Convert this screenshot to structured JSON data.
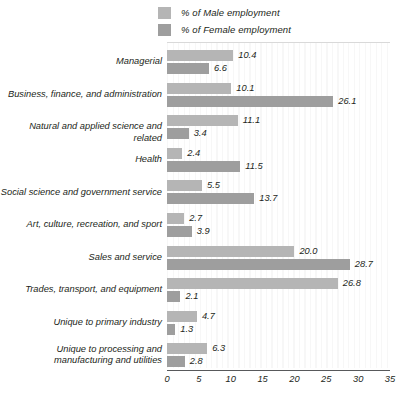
{
  "legend": {
    "items": [
      {
        "label": "% of Male employment",
        "swatch": "legend-swatch-male",
        "color": "#b5b5b5"
      },
      {
        "label": "% of Female employment",
        "swatch": "legend-swatch-female",
        "color": "#9e9e9e"
      }
    ]
  },
  "axis": {
    "ticks": [
      "0",
      "5",
      "10",
      "15",
      "20",
      "25",
      "30",
      "35"
    ]
  },
  "chart_data": {
    "type": "bar",
    "orientation": "horizontal",
    "title": "",
    "subtitle": "",
    "xlabel": "",
    "ylabel": "",
    "xlim": [
      0,
      35
    ],
    "xticks": [
      0,
      5,
      10,
      15,
      20,
      25,
      30,
      35
    ],
    "grid": true,
    "legend_position": "top",
    "categories": [
      "Managerial",
      "Business, finance, and administration",
      "Natural and applied science and related",
      "Health",
      "Social science and government service",
      "Art, culture, recreation, and sport",
      "Sales and service",
      "Trades, transport, and equipment",
      "Unique to primary industry",
      "Unique to processing and manufacturing and utilities"
    ],
    "series": [
      {
        "name": "% of Male employment",
        "color": "#b5b5b5",
        "values": [
          10.4,
          10.1,
          11.1,
          2.4,
          5.5,
          2.7,
          20.0,
          26.8,
          4.7,
          6.3
        ],
        "labels": [
          "10.4",
          "10.1",
          "11.1",
          "2.4",
          "5.5",
          "2.7",
          "20.0",
          "26.8",
          "4.7",
          "6.3"
        ]
      },
      {
        "name": "% of Female employment",
        "color": "#9e9e9e",
        "values": [
          6.6,
          26.1,
          3.4,
          11.5,
          13.7,
          3.9,
          28.7,
          2.1,
          1.3,
          2.8
        ],
        "labels": [
          "6.6",
          "26.1",
          "3.4",
          "11.5",
          "13.7",
          "3.9",
          "28.7",
          "2.1",
          "1.3",
          "2.8"
        ]
      }
    ]
  }
}
